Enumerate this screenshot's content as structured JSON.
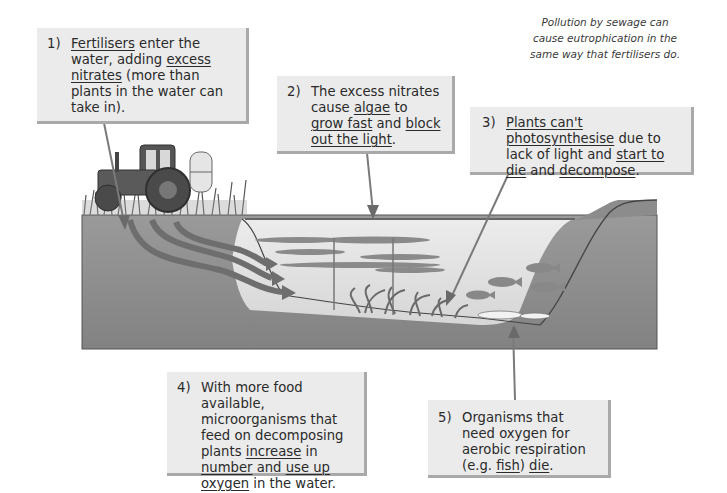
{
  "title": "Eutrophication",
  "note": {
    "lines": [
      "Pollution by sewage can",
      "cause eutrophication in the",
      "same way that fertilisers do."
    ]
  },
  "steps": [
    {
      "number": "1)",
      "parts": [
        {
          "text": "Fertilisers",
          "underline": true
        },
        {
          "text": " enter the water, adding ",
          "underline": false
        },
        {
          "text": "excess nitrates",
          "underline": true
        },
        {
          "text": " (more than plants in the water can take in).",
          "underline": false
        }
      ]
    },
    {
      "number": "2)",
      "parts": [
        {
          "text": "The excess nitrates cause ",
          "underline": false
        },
        {
          "text": "algae",
          "underline": true
        },
        {
          "text": " to ",
          "underline": false
        },
        {
          "text": "grow fast",
          "underline": true
        },
        {
          "text": " and ",
          "underline": false
        },
        {
          "text": "block out the light",
          "underline": true
        },
        {
          "text": ".",
          "underline": false
        }
      ]
    },
    {
      "number": "3)",
      "parts": [
        {
          "text": "Plants can't photosynthesise",
          "underline": true
        },
        {
          "text": " due to lack of light and ",
          "underline": false
        },
        {
          "text": "start to die",
          "underline": true
        },
        {
          "text": " and ",
          "underline": false
        },
        {
          "text": "decompose",
          "underline": true
        },
        {
          "text": ".",
          "underline": false
        }
      ]
    },
    {
      "number": "4)",
      "parts": [
        {
          "text": "With more food available, microorganisms that feed on decomposing plants ",
          "underline": false
        },
        {
          "text": "increase",
          "underline": true
        },
        {
          "text": " in ",
          "underline": false
        },
        {
          "text": "number",
          "underline": true
        },
        {
          "text": " and ",
          "underline": false
        },
        {
          "text": "use up oxygen",
          "underline": true
        },
        {
          "text": " in the water.",
          "underline": false
        }
      ]
    },
    {
      "number": "5)",
      "parts": [
        {
          "text": "Organisms that need oxygen for aerobic respiration (e.g. ",
          "underline": false
        },
        {
          "text": "fish",
          "underline": true
        },
        {
          "text": ") ",
          "underline": false
        },
        {
          "text": "die",
          "underline": true
        },
        {
          "text": ".",
          "underline": false
        }
      ]
    }
  ],
  "illustration": {
    "elements": [
      "tractor",
      "grass",
      "soil-cross-section",
      "nitrate-runoff-arrows",
      "lake-water",
      "algae-layer",
      "underwater-plants",
      "live-fish",
      "dead-fish"
    ],
    "colors": {
      "soil": "#8c8c8c",
      "water": "#e3e3e3",
      "box": "#ebebeb",
      "box_shadow": "#a9a9a9",
      "arrow": "#6e6e6e"
    }
  }
}
